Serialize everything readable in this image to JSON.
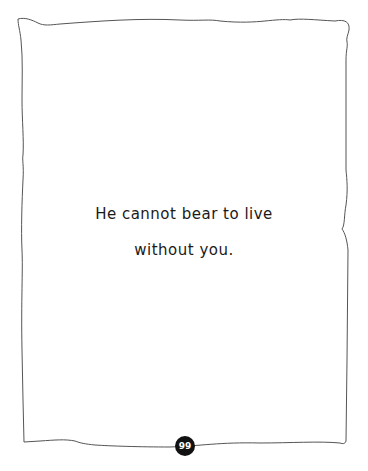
{
  "page": {
    "lines": [
      "He cannot bear to live",
      "without you."
    ],
    "page_number": "99"
  },
  "colors": {
    "border": "#555555",
    "text": "#1a1a1a",
    "page_badge": "#111111"
  }
}
